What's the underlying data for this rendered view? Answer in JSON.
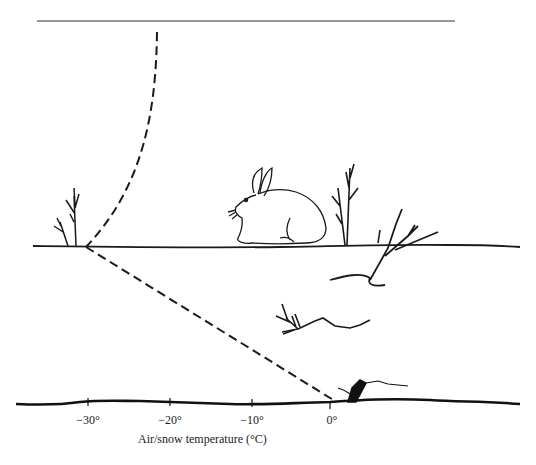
{
  "diagram": {
    "x_axis": {
      "title": "Air/snow temperature (°C)",
      "ticks": [
        {
          "label": "−30°",
          "x": 88
        },
        {
          "label": "−20°",
          "x": 170
        },
        {
          "label": "−10°",
          "x": 252
        },
        {
          "label": "0°",
          "x": 330
        }
      ]
    },
    "elements": {
      "top_line": "air-top",
      "snow_surface": "snow-surface",
      "ground": "ground-surface",
      "animal": "snowshoe-hare",
      "air_temperature_curve": "dashed",
      "snow_temperature_gradient": "dashed"
    },
    "colors": {
      "ink": "#1a1a1a",
      "background": "#ffffff"
    }
  }
}
